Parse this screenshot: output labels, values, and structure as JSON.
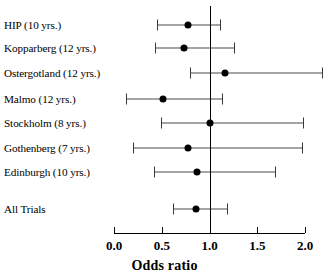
{
  "chart_data": {
    "type": "scatter",
    "title": "",
    "xlabel": "Odds ratio",
    "ylabel": "",
    "xlim": [
      0.0,
      2.0
    ],
    "grid": false,
    "legend": "none",
    "reference_line": 1.0,
    "xticks": [
      "0.0",
      "0.5",
      "1.0",
      "1.5",
      "2.0"
    ],
    "xtick_values": [
      0.0,
      0.5,
      1.0,
      1.5,
      2.0
    ],
    "categories": [
      "HIP (10 yrs.)",
      "Kopparberg (12 yrs.)",
      "Ostergotland  (12 yrs.)",
      "Malmo (12 yrs.)",
      "Stockholm (8 yrs.)",
      "Gothenberg  (7 yrs.)",
      "Edinburgh (10 yrs.)",
      "All Trials"
    ],
    "values": [
      0.77,
      0.73,
      1.16,
      0.51,
      1.0,
      0.78,
      0.87,
      0.86
    ],
    "ci_lower": [
      0.45,
      0.43,
      0.8,
      0.13,
      0.49,
      0.2,
      0.42,
      0.62
    ],
    "ci_upper": [
      1.11,
      1.26,
      2.18,
      1.13,
      1.98,
      1.97,
      1.69,
      1.18
    ],
    "rows": [
      {
        "label": "HIP (10 yrs.)",
        "or": 0.77,
        "low": 0.45,
        "high": 1.11,
        "y": 25
      },
      {
        "label": "Kopparberg (12 yrs.)",
        "or": 0.73,
        "low": 0.43,
        "high": 1.26,
        "y": 48
      },
      {
        "label": "Ostergotland  (12 yrs.)",
        "or": 1.16,
        "low": 0.8,
        "high": 2.18,
        "y": 73
      },
      {
        "label": "Malmo (12 yrs.)",
        "or": 0.51,
        "low": 0.13,
        "high": 1.13,
        "y": 99
      },
      {
        "label": "Stockholm (8 yrs.)",
        "or": 1.0,
        "low": 0.49,
        "high": 1.98,
        "y": 123
      },
      {
        "label": "Gothenberg  (7 yrs.)",
        "or": 0.78,
        "low": 0.2,
        "high": 1.97,
        "y": 148
      },
      {
        "label": "Edinburgh (10 yrs.)",
        "or": 0.87,
        "low": 0.42,
        "high": 1.69,
        "y": 172
      },
      {
        "label": "All Trials",
        "or": 0.86,
        "low": 0.62,
        "high": 1.18,
        "y": 209
      }
    ],
    "colors": {
      "point": "#000000",
      "line": "#4a4a4a",
      "axis": "#000000",
      "background": "#ffffff"
    }
  }
}
